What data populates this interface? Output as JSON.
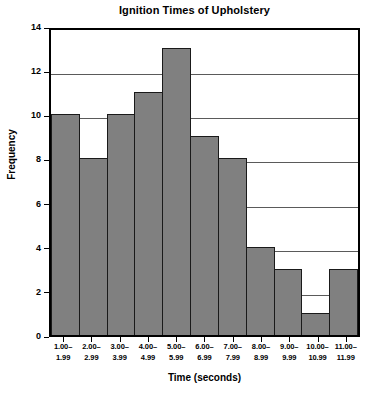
{
  "chart_data": {
    "type": "bar",
    "title": "Ignition Times of Upholstery",
    "xlabel": "Time (seconds)",
    "ylabel": "Frequency",
    "categories": [
      "1.00–1.99",
      "2.00–2.99",
      "3.00–3.99",
      "4.00–4.99",
      "5.00–5.99",
      "6.00–6.99",
      "7.00–7.99",
      "8.00–8.99",
      "9.00–9.99",
      "10.00–10.99",
      "11.00–11.99"
    ],
    "bin_labels": [
      {
        "lo": "1.00–",
        "hi": "1.99"
      },
      {
        "lo": "2.00–",
        "hi": "2.99"
      },
      {
        "lo": "3.00–",
        "hi": "3.99"
      },
      {
        "lo": "4.00–",
        "hi": "4.99"
      },
      {
        "lo": "5.00–",
        "hi": "5.99"
      },
      {
        "lo": "6.00–",
        "hi": "6.99"
      },
      {
        "lo": "7.00–",
        "hi": "7.99"
      },
      {
        "lo": "8.00–",
        "hi": "8.99"
      },
      {
        "lo": "9.00–",
        "hi": "9.99"
      },
      {
        "lo": "10.00–",
        "hi": "10.99"
      },
      {
        "lo": "11.00–",
        "hi": "11.99"
      }
    ],
    "values": [
      10,
      8,
      10,
      11,
      13,
      9,
      8,
      4,
      3,
      1,
      3
    ],
    "ylim": [
      0,
      14
    ],
    "yticks": [
      0,
      2,
      4,
      6,
      8,
      10,
      12,
      14
    ],
    "ytick_labels": [
      "0",
      "2",
      "4",
      "6",
      "8",
      "10",
      "12",
      "14"
    ],
    "grid": "horizontal-at-yticks",
    "gridlines_at": [
      2,
      4,
      6,
      8,
      10,
      12
    ],
    "legend": null,
    "bar_color": "#808080",
    "bar_edge_color": "#1a1a1a",
    "axis_color": "#000000",
    "grid_color": "#5a5a5a",
    "background_color": "#ffffff"
  }
}
